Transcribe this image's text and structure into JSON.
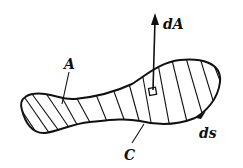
{
  "diagram": {
    "labels": {
      "area": "A",
      "curve": "C",
      "area_element": "dA",
      "line_element": "ds"
    },
    "colors": {
      "ink": "#111111",
      "background": "#ffffff"
    }
  }
}
